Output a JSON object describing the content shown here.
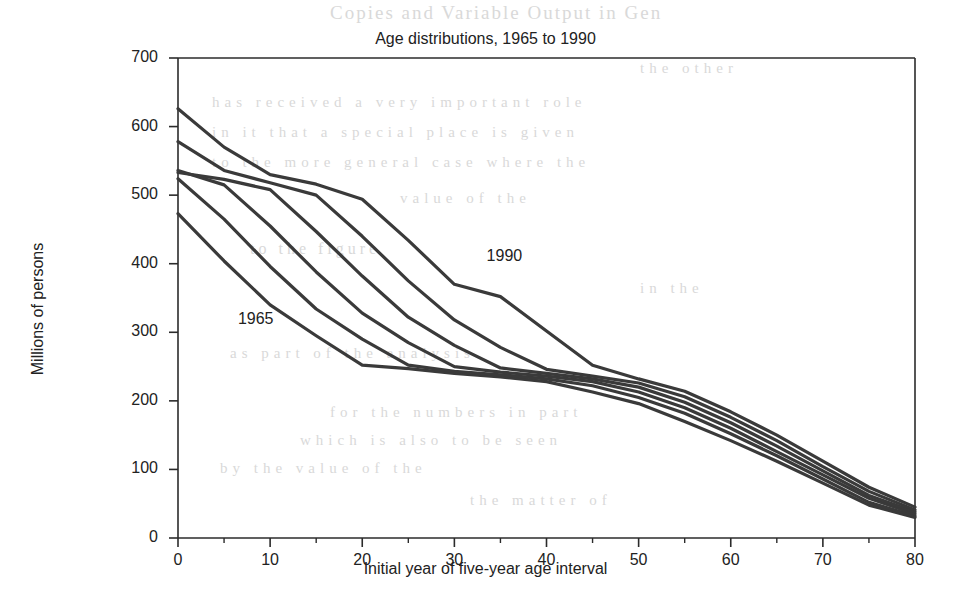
{
  "chart_data": {
    "type": "line",
    "title": "Age distributions, 1965 to 1990",
    "xlabel": "Initial year of five-year age interval",
    "ylabel": "Millions of persons",
    "xlim": [
      0,
      80
    ],
    "ylim": [
      0,
      700
    ],
    "xticks": [
      0,
      10,
      20,
      30,
      40,
      50,
      60,
      70,
      80
    ],
    "yticks": [
      0,
      100,
      200,
      300,
      400,
      500,
      600,
      700
    ],
    "grid": false,
    "legend": "inline-annotations",
    "line_color": "#3a3a3a",
    "background_color": "#ffffff",
    "annotations": [
      {
        "text": "1965",
        "x": 6.5,
        "y": 318
      },
      {
        "text": "1990",
        "x": 33.5,
        "y": 410
      }
    ],
    "x": [
      0,
      5,
      10,
      15,
      20,
      25,
      30,
      35,
      40,
      45,
      50,
      55,
      60,
      65,
      70,
      75,
      80
    ],
    "series": [
      {
        "name": "1965",
        "values": [
          473,
          404,
          340,
          295,
          252,
          247,
          240,
          235,
          228,
          213,
          196,
          170,
          142,
          112,
          80,
          48,
          30
        ]
      },
      {
        "name": "1970",
        "values": [
          524,
          465,
          396,
          334,
          290,
          252,
          243,
          238,
          232,
          222,
          205,
          182,
          152,
          120,
          86,
          52,
          32
        ]
      },
      {
        "name": "1975",
        "values": [
          536,
          515,
          455,
          388,
          328,
          285,
          250,
          242,
          236,
          228,
          213,
          190,
          160,
          126,
          92,
          58,
          35
        ]
      },
      {
        "name": "1980",
        "values": [
          533,
          523,
          508,
          447,
          382,
          322,
          281,
          248,
          240,
          232,
          220,
          198,
          168,
          134,
          98,
          62,
          38
        ]
      },
      {
        "name": "1985",
        "values": [
          578,
          536,
          518,
          500,
          440,
          375,
          318,
          278,
          246,
          236,
          226,
          206,
          176,
          142,
          104,
          68,
          41
        ]
      },
      {
        "name": "1990",
        "values": [
          626,
          570,
          530,
          516,
          494,
          434,
          370,
          352,
          302,
          252,
          232,
          214,
          184,
          150,
          112,
          74,
          45
        ]
      }
    ]
  },
  "ghost_text": {
    "t1": "Copies and Variable Output in Gen",
    "t2": "has received  a very important role",
    "t3": "in it that a special  place is given",
    "t4": "to the more general  case where the",
    "t5": "value of the",
    "t6": "to the figure",
    "t7": "as part of the analysis",
    "t8": "for the numbers in part",
    "t9": "which is also to be seen",
    "t10": "by the value of the",
    "t11": "the matter of",
    "t12": "the other",
    "t13": "in the"
  }
}
